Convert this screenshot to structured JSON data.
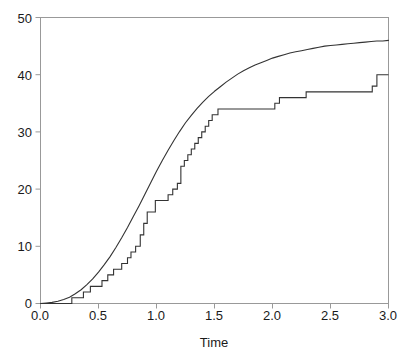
{
  "chart_data": {
    "type": "line",
    "title": "",
    "subtitle": "",
    "xlabel": "Time",
    "ylabel": "",
    "xlim": [
      0.0,
      3.0
    ],
    "ylim": [
      0,
      50
    ],
    "grid": false,
    "legend_position": "none",
    "xticks": [
      0.0,
      0.5,
      1.0,
      1.5,
      2.0,
      2.5,
      3.0
    ],
    "xtick_labels": [
      "0.0",
      "0.5",
      "1.0",
      "1.5",
      "2.0",
      "2.5",
      "3.0"
    ],
    "yticks": [
      0,
      10,
      20,
      30,
      40,
      50
    ],
    "ytick_labels": [
      "0",
      "10",
      "20",
      "30",
      "40",
      "50"
    ],
    "frame_color": "#999999",
    "line_color": "#333333",
    "annotations": [],
    "series": [
      {
        "name": "smooth-cumulative-curve",
        "type": "line",
        "style": "solid",
        "color": "#333333",
        "x": [
          0.0,
          0.05,
          0.1,
          0.15,
          0.2,
          0.25,
          0.3,
          0.35,
          0.4,
          0.45,
          0.5,
          0.55,
          0.6,
          0.65,
          0.7,
          0.75,
          0.8,
          0.85,
          0.9,
          0.95,
          1.0,
          1.05,
          1.1,
          1.15,
          1.2,
          1.25,
          1.3,
          1.35,
          1.4,
          1.45,
          1.5,
          1.55,
          1.6,
          1.65,
          1.7,
          1.75,
          1.8,
          1.85,
          1.9,
          1.95,
          2.0,
          2.05,
          2.1,
          2.15,
          2.2,
          2.25,
          2.3,
          2.35,
          2.4,
          2.45,
          2.5,
          2.55,
          2.6,
          2.65,
          2.7,
          2.75,
          2.8,
          2.85,
          2.9,
          2.95,
          3.0
        ],
        "y": [
          0.0,
          0.1,
          0.2,
          0.4,
          0.7,
          1.1,
          1.7,
          2.4,
          3.3,
          4.3,
          5.5,
          6.8,
          8.2,
          9.8,
          11.5,
          13.3,
          15.2,
          17.1,
          19.1,
          21.1,
          23.1,
          25.0,
          26.8,
          28.5,
          30.1,
          31.6,
          32.9,
          34.1,
          35.2,
          36.2,
          37.1,
          37.9,
          38.7,
          39.4,
          40.1,
          40.7,
          41.2,
          41.7,
          42.1,
          42.5,
          42.9,
          43.2,
          43.5,
          43.8,
          44.0,
          44.2,
          44.4,
          44.6,
          44.8,
          45.0,
          45.1,
          45.2,
          45.3,
          45.4,
          45.5,
          45.6,
          45.7,
          45.8,
          45.9,
          45.9,
          46.0
        ]
      },
      {
        "name": "empirical-step-function",
        "type": "step",
        "style": "solid",
        "color": "#333333",
        "x": [
          0.0,
          0.2,
          0.27,
          0.37,
          0.43,
          0.47,
          0.53,
          0.58,
          0.63,
          0.7,
          0.75,
          0.78,
          0.82,
          0.86,
          0.89,
          0.92,
          0.99,
          1.06,
          1.1,
          1.14,
          1.18,
          1.21,
          1.24,
          1.27,
          1.3,
          1.33,
          1.36,
          1.39,
          1.42,
          1.45,
          1.48,
          1.51,
          1.53,
          1.99,
          2.02,
          2.06,
          2.27,
          2.29,
          2.86,
          2.9,
          3.0
        ],
        "y": [
          0,
          0,
          1,
          2,
          3,
          3,
          4,
          5,
          6,
          7,
          8,
          9,
          10,
          12,
          14,
          16,
          18,
          18,
          19,
          20,
          21,
          24,
          25,
          26,
          27,
          28,
          29,
          30,
          31,
          32,
          33,
          33,
          34,
          34,
          35,
          36,
          36,
          37,
          38,
          40,
          40
        ]
      }
    ]
  },
  "axis": {
    "x_label": "Time",
    "x_tick_0": "0.0",
    "x_tick_1": "0.5",
    "x_tick_2": "1.0",
    "x_tick_3": "1.5",
    "x_tick_4": "2.0",
    "x_tick_5": "2.5",
    "x_tick_6": "3.0",
    "y_tick_0": "0",
    "y_tick_1": "10",
    "y_tick_2": "20",
    "y_tick_3": "30",
    "y_tick_4": "40",
    "y_tick_5": "50"
  }
}
